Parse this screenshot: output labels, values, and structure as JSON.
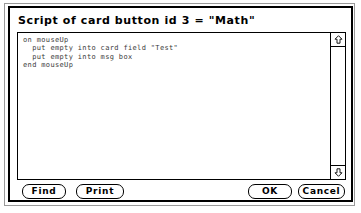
{
  "window": {
    "title": "Script of card button id 3 = \"Math\"",
    "kind": "script-editor-dialog"
  },
  "script": {
    "content": "on mouseUp\n  put empty into card field \"Test\"\n  put empty into msg box\nend mouseUp",
    "lines": [
      "on mouseUp",
      "  put empty into card field \"Test\"",
      "  put empty into msg box",
      "end mouseUp"
    ]
  },
  "scrollbar": {
    "up_arrow_icon": "arrow-up-icon",
    "down_arrow_icon": "arrow-down-icon",
    "orientation": "vertical",
    "thumb_visible": false
  },
  "buttons": {
    "find": "Find",
    "print": "Print",
    "ok": "OK",
    "cancel": "Cancel"
  },
  "colors": {
    "window_border": "#000000",
    "shadow_border": "#9a9a9a",
    "background": "#ffffff",
    "text": "#000000",
    "script_text": "#3a3a3a"
  }
}
